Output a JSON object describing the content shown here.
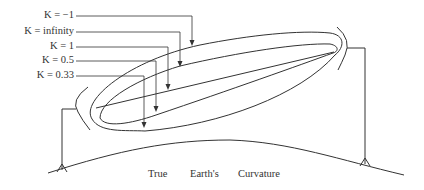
{
  "diagram": {
    "labels": [
      {
        "text": "K = −1"
      },
      {
        "text": "K = infinity"
      },
      {
        "text": "K = 1"
      },
      {
        "text": "K = 0.5"
      },
      {
        "text": "K = 0.33"
      }
    ],
    "caption": {
      "word1": "True",
      "word2": "Earth's",
      "word3": "Curvature"
    },
    "line_color": "#333333",
    "text_color": "#333333"
  }
}
